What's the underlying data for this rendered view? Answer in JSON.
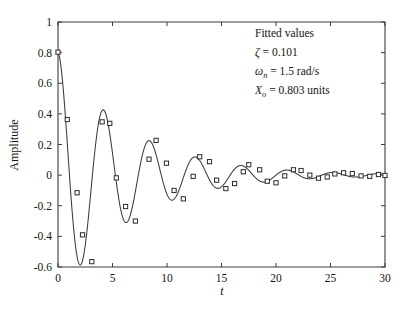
{
  "chart_data": {
    "type": "line",
    "title": "",
    "xlabel": "t",
    "ylabel": "Amplitude",
    "xlim": [
      0,
      30
    ],
    "ylim": [
      -0.6,
      1
    ],
    "grid": false,
    "legend": "none",
    "xticks": [
      "0",
      "5",
      "10",
      "15",
      "20",
      "25",
      "30"
    ],
    "xtick_values": [
      0,
      5,
      10,
      15,
      20,
      25,
      30
    ],
    "yticks": [
      "1",
      "0.8",
      "0.6",
      "0.4",
      "0.2",
      "0",
      "-0.2",
      "-0.4",
      "-0.6"
    ],
    "ytick_values": [
      1,
      0.8,
      0.6,
      0.4,
      0.2,
      0,
      -0.2,
      -0.4,
      -0.6
    ],
    "series": [
      {
        "name": "fitted curve",
        "style": "line",
        "color": "#3a3a3a",
        "model": "X_o * exp(-zeta*omega_n*t) * cos(omega_d*t)",
        "zeta": 0.101,
        "omega_n": 1.5,
        "X_o": 0.803
      },
      {
        "name": "measured data",
        "style": "square-markers",
        "color": "#2b2b2b",
        "x": [
          0.0,
          0.85,
          1.75,
          2.25,
          3.1,
          4.05,
          4.75,
          5.35,
          6.2,
          7.1,
          8.35,
          9.0,
          9.95,
          10.65,
          11.5,
          12.4,
          13.0,
          13.9,
          14.55,
          15.4,
          16.2,
          17.0,
          17.5,
          18.5,
          19.2,
          20.0,
          20.8,
          21.6,
          22.3,
          23.1,
          23.9,
          24.7,
          25.4,
          26.2,
          27.0,
          27.8,
          28.6,
          29.4,
          30.0
        ],
        "y": [
          0.803,
          0.363,
          -0.115,
          -0.39,
          -0.565,
          0.348,
          0.338,
          -0.018,
          -0.205,
          -0.3,
          0.104,
          0.227,
          0.078,
          -0.1,
          -0.155,
          -0.008,
          0.12,
          0.088,
          -0.033,
          -0.088,
          -0.055,
          0.022,
          0.068,
          0.035,
          -0.04,
          -0.05,
          -0.005,
          0.035,
          0.03,
          0.0,
          -0.02,
          -0.012,
          0.008,
          0.015,
          0.01,
          -0.005,
          -0.008,
          0.004,
          -0.002
        ]
      }
    ],
    "annotations": {
      "title": "Fitted values",
      "lines": [
        {
          "symbol": "ζ",
          "sub": "",
          "value": "= 0.101"
        },
        {
          "symbol": "ω",
          "sub": "n",
          "value": "= 1.5 rad/s"
        },
        {
          "symbol": "X",
          "sub": "o",
          "value": "= 0.803 units"
        }
      ]
    }
  },
  "labels": {
    "ylabel": "Amplitude",
    "xlabel": "t"
  },
  "colors": {
    "curve": "#3a3a3a",
    "marker_edge": "#2b2b2b",
    "marker_fill": "#ffffff",
    "axis": "#3c3c3c",
    "text": "#141414",
    "background": "#ffffff"
  }
}
